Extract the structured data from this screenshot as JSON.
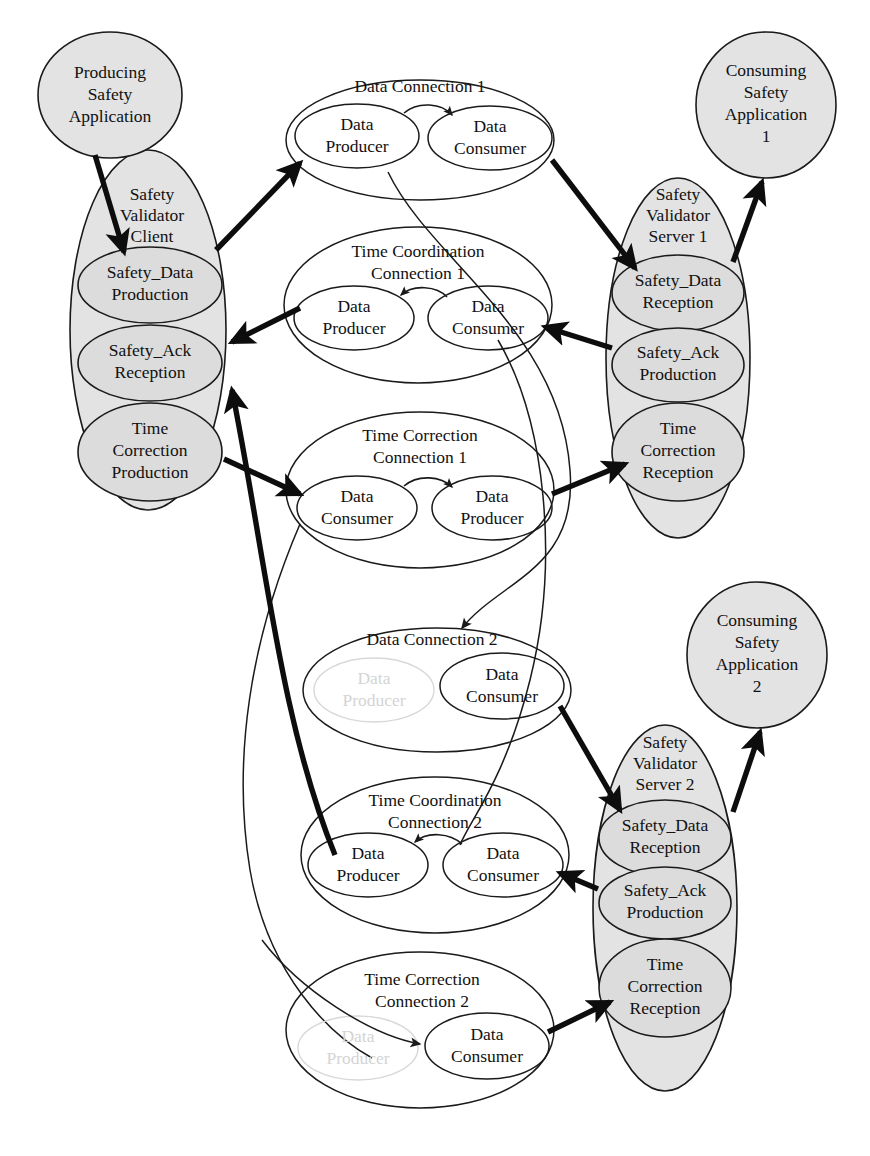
{
  "diagram": {
    "colors": {
      "node_fill_shaded": "#e3e3e3",
      "node_fill_plain": "#ffffff",
      "stroke": "#1a1a1a",
      "ghost": "#d8d8d8",
      "edge_thick": "#0d0d0d"
    },
    "applications": [
      {
        "id": "producing-safety-application",
        "label": "Producing\nSafety\nApplication",
        "lines": [
          "Producing",
          "Safety",
          "Application"
        ]
      },
      {
        "id": "consuming-safety-application-1",
        "label": "Consuming Safety Application 1",
        "lines": [
          "Consuming",
          "Safety",
          "Application",
          "1"
        ]
      },
      {
        "id": "consuming-safety-application-2",
        "label": "Consuming Safety Application 2",
        "lines": [
          "Consuming",
          "Safety",
          "Application",
          "2"
        ]
      }
    ],
    "validators": [
      {
        "id": "safety-validator-client",
        "title_lines": [
          "Safety",
          "Validator",
          "Client"
        ],
        "slots": [
          {
            "id": "client-safety-data-production",
            "lines": [
              "Safety_Data",
              "Production"
            ]
          },
          {
            "id": "client-safety-ack-reception",
            "lines": [
              "Safety_Ack",
              "Reception"
            ]
          },
          {
            "id": "client-time-correction-production",
            "lines": [
              "Time",
              "Correction",
              "Production"
            ]
          }
        ]
      },
      {
        "id": "safety-validator-server-1",
        "title_lines": [
          "Safety",
          "Validator",
          "Server 1"
        ],
        "slots": [
          {
            "id": "server1-safety-data-reception",
            "lines": [
              "Safety_Data",
              "Reception"
            ]
          },
          {
            "id": "server1-safety-ack-production",
            "lines": [
              "Safety_Ack",
              "Production"
            ]
          },
          {
            "id": "server1-time-correction-reception",
            "lines": [
              "Time",
              "Correction",
              "Reception"
            ]
          }
        ]
      },
      {
        "id": "safety-validator-server-2",
        "title_lines": [
          "Safety",
          "Validator",
          "Server 2"
        ],
        "slots": [
          {
            "id": "server2-safety-data-reception",
            "lines": [
              "Safety_Data",
              "Reception"
            ]
          },
          {
            "id": "server2-safety-ack-production",
            "lines": [
              "Safety_Ack",
              "Production"
            ]
          },
          {
            "id": "server2-time-correction-reception",
            "lines": [
              "Time",
              "Correction",
              "Reception"
            ]
          }
        ]
      }
    ],
    "connections": [
      {
        "id": "data-connection-1",
        "title_lines": [
          "Data Connection 1"
        ],
        "left": {
          "id": "dc1-data-producer",
          "lines": [
            "Data",
            "Producer"
          ],
          "ghost": false
        },
        "right": {
          "id": "dc1-data-consumer",
          "lines": [
            "Data",
            "Consumer"
          ],
          "ghost": false
        },
        "inner_arrow_direction": "left-to-right"
      },
      {
        "id": "time-coordination-connection-1",
        "title_lines": [
          "Time Coordination",
          "Connection 1"
        ],
        "left": {
          "id": "tcoord1-data-producer",
          "lines": [
            "Data",
            "Producer"
          ],
          "ghost": false
        },
        "right": {
          "id": "tcoord1-data-consumer",
          "lines": [
            "Data",
            "Consumer"
          ],
          "ghost": false
        },
        "inner_arrow_direction": "right-to-left"
      },
      {
        "id": "time-correction-connection-1",
        "title_lines": [
          "Time Correction",
          "Connection 1"
        ],
        "left": {
          "id": "tcorr1-data-consumer",
          "lines": [
            "Data",
            "Consumer"
          ],
          "ghost": false
        },
        "right": {
          "id": "tcorr1-data-producer",
          "lines": [
            "Data",
            "Producer"
          ],
          "ghost": false
        },
        "inner_arrow_direction": "left-to-right"
      },
      {
        "id": "data-connection-2",
        "title_lines": [
          "Data Connection 2"
        ],
        "left": {
          "id": "dc2-data-producer",
          "lines": [
            "Data",
            "Producer"
          ],
          "ghost": true
        },
        "right": {
          "id": "dc2-data-consumer",
          "lines": [
            "Data",
            "Consumer"
          ],
          "ghost": false
        },
        "inner_arrow_direction": "none"
      },
      {
        "id": "time-coordination-connection-2",
        "title_lines": [
          "Time Coordination",
          "Connection 2"
        ],
        "left": {
          "id": "tcoord2-data-producer",
          "lines": [
            "Data",
            "Producer"
          ],
          "ghost": false
        },
        "right": {
          "id": "tcoord2-data-consumer",
          "lines": [
            "Data",
            "Consumer"
          ],
          "ghost": false
        },
        "inner_arrow_direction": "right-to-left"
      },
      {
        "id": "time-correction-connection-2",
        "title_lines": [
          "Time Correction",
          "Connection 2"
        ],
        "left": {
          "id": "tcorr2-data-producer",
          "lines": [
            "Data",
            "Producer"
          ],
          "ghost": true
        },
        "right": {
          "id": "tcorr2-data-consumer",
          "lines": [
            "Data",
            "Consumer"
          ],
          "ghost": false
        },
        "inner_arrow_direction": "none"
      }
    ],
    "text": {
      "producing_safety_application_l1": "Producing",
      "producing_safety_application_l2": "Safety",
      "producing_safety_application_l3": "Application",
      "consuming_1_l1": "Consuming",
      "consuming_1_l2": "Safety",
      "consuming_1_l3": "Application",
      "consuming_1_l4": "1",
      "consuming_2_l1": "Consuming",
      "consuming_2_l2": "Safety",
      "consuming_2_l3": "Application",
      "consuming_2_l4": "2",
      "svc_l1": "Safety",
      "svc_l2": "Validator",
      "svc_l3": "Client",
      "svs1_l1": "Safety",
      "svs1_l2": "Validator",
      "svs1_l3": "Server 1",
      "svs2_l1": "Safety",
      "svs2_l2": "Validator",
      "svs2_l3": "Server 2",
      "safety_data_production_l1": "Safety_Data",
      "safety_data_production_l2": "Production",
      "safety_ack_reception_l1": "Safety_Ack",
      "safety_ack_reception_l2": "Reception",
      "time_correction_production_l1": "Time",
      "time_correction_production_l2": "Correction",
      "time_correction_production_l3": "Production",
      "safety_data_reception_l1": "Safety_Data",
      "safety_data_reception_l2": "Reception",
      "safety_ack_production_l1": "Safety_Ack",
      "safety_ack_production_l2": "Production",
      "time_correction_reception_l1": "Time",
      "time_correction_reception_l2": "Correction",
      "time_correction_reception_l3": "Reception",
      "data_connection_1": "Data Connection 1",
      "time_coordination_connection_l1": "Time Coordination",
      "time_coordination_connection_1_l2": "Connection 1",
      "time_correction_connection_l1": "Time Correction",
      "time_correction_connection_1_l2": "Connection 1",
      "data_connection_2": "Data Connection 2",
      "time_coordination_connection_2_l2": "Connection 2",
      "time_correction_connection_2_l2": "Connection 2",
      "data": "Data",
      "producer": "Producer",
      "consumer": "Consumer"
    }
  }
}
